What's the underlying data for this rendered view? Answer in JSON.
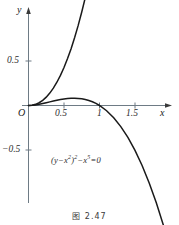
{
  "figure": {
    "caption": "图 2.47",
    "equation_text": "(y−x²)²−x⁵=0",
    "equation_parts": {
      "lead": "(y−x",
      "sup1": "2",
      "mid": ")",
      "sup2": "2",
      "minus": "−x",
      "sup3": "5",
      "tail": "=0"
    }
  },
  "chart_data": {
    "type": "line",
    "title": "",
    "subtitle": "",
    "xlabel": "x",
    "ylabel": "y",
    "annotations": [
      {
        "text": "(y−x²)²−x⁵=0",
        "x": 0.55,
        "y": -0.33
      }
    ],
    "xlim": [
      -0.12,
      1.92
    ],
    "ylim": [
      -0.92,
      1.12
    ],
    "xticks": [
      0.5,
      1,
      1.5
    ],
    "xtick_labels": [
      "0.5",
      "1",
      "1.5"
    ],
    "yticks": [
      0.5,
      -0.5
    ],
    "ytick_labels": [
      "0.5",
      "−0.5"
    ],
    "origin_label": "O",
    "grid": false,
    "legend": "none",
    "axis_arrows": true,
    "series": [
      {
        "name": "upper branch  y = x² + x^(5/2)",
        "color": "#1a1a1a",
        "x": [
          0,
          0.05,
          0.1,
          0.15,
          0.2,
          0.25,
          0.3,
          0.35,
          0.4,
          0.45,
          0.5,
          0.55,
          0.6,
          0.65,
          0.7,
          0.75,
          0.8,
          0.85,
          0.9
        ],
        "y": [
          0,
          0.0031,
          0.0132,
          0.0312,
          0.0579,
          0.0938,
          0.1393,
          0.1949,
          0.2612,
          0.3383,
          0.4268,
          0.5269,
          0.6389,
          0.7633,
          0.9002,
          1.0499,
          1.2127,
          1.3888,
          1.5784
        ]
      },
      {
        "name": "lower branch  y = x² − x^(5/2)",
        "color": "#1a1a1a",
        "x": [
          0,
          0.05,
          0.1,
          0.15,
          0.2,
          0.25,
          0.3,
          0.35,
          0.4,
          0.45,
          0.5,
          0.55,
          0.6,
          0.65,
          0.7,
          0.75,
          0.8,
          0.85,
          0.9,
          0.95,
          1.0,
          1.1,
          1.2,
          1.3,
          1.4,
          1.5,
          1.6,
          1.7,
          1.8,
          1.9
        ],
        "y": [
          0,
          0.0019,
          0.0068,
          0.0138,
          0.0221,
          0.0312,
          0.0407,
          0.0501,
          0.0588,
          0.0667,
          0.0732,
          0.0781,
          0.0811,
          0.0817,
          0.0798,
          0.0751,
          0.0673,
          0.0562,
          0.0416,
          0.0232,
          0,
          -0.0588,
          -0.1375,
          -0.2371,
          -0.3588,
          -0.504,
          -0.6739,
          -0.8698,
          -1.0931,
          -1.345
        ]
      }
    ]
  }
}
